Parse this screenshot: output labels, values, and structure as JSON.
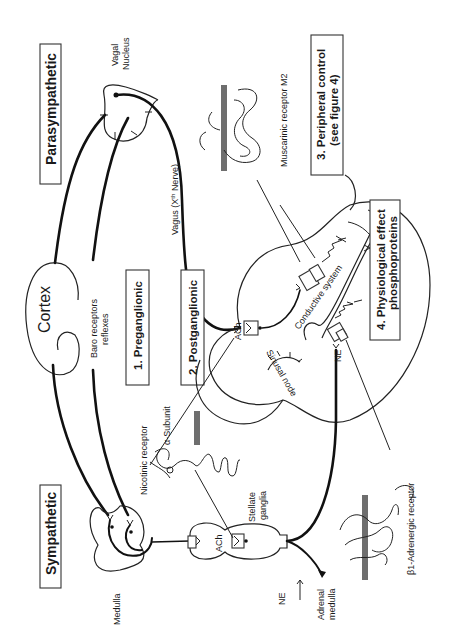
{
  "figure": {
    "orientation": "rotated-90-ccw",
    "titles": {
      "parasympathetic": "Parasympathetic",
      "sympathetic": "Sympathetic"
    },
    "stages": {
      "preganglionic": "1. Preganglionic",
      "postganglionic": "2.  Postganglionic",
      "peripheral_line1": "3. Peripheral control",
      "peripheral_line2": "(see figure 4)",
      "physiological_line1": "4. Physiological effect",
      "physiological_line2": "phosphoproteins"
    },
    "labels": {
      "vagal_nucleus_1": "Vagal",
      "vagal_nucleus_2": "Nucleus",
      "muscarinic": "Muscarinic receptor M2",
      "vagus_prefix": "Vagus (X",
      "vagus_sup": "th",
      "vagus_suffix": " Nerve)",
      "cortex": "Cortex",
      "baro_1": "Baro receptors",
      "baro_2": "reflexes",
      "ach_heart": "ACh",
      "conductive": "Conductive system",
      "sinusal": "Sinusal node",
      "ne_heart": "NE",
      "nicotinic": "Nicotinic receptor",
      "alpha_subunit": "α-Subunit",
      "medulla": "Medulla",
      "ach_ganglia": "ACh",
      "stellate_1": "Stellate",
      "stellate_2": "ganglia",
      "beta1": "β1-Adrenergic receptor",
      "ne_adrenal": "NE",
      "adrenal_1": "Adrenal",
      "adrenal_2": "medulla"
    },
    "colors": {
      "ink": "#111111",
      "membrane": "#6e6e6e",
      "background": "#ffffff"
    }
  }
}
